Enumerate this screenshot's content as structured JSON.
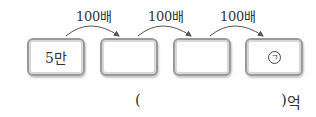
{
  "problem": {
    "start_value": "5만",
    "step_label": "100배",
    "steps": [
      "100배",
      "100배",
      "100배"
    ],
    "boxes": [
      "5만",
      "",
      "",
      "㉠"
    ],
    "target_marker": "ㄱ",
    "answer_open": "(",
    "answer_close": ")",
    "answer_unit": "억",
    "answer_value": ""
  }
}
